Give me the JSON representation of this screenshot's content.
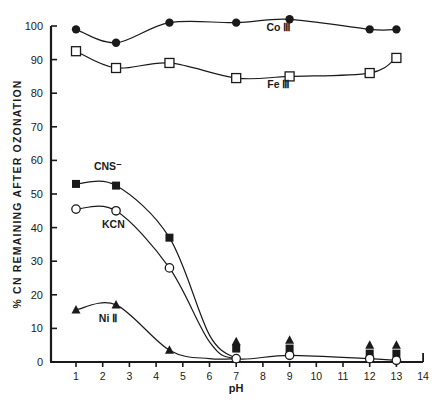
{
  "chart_data": {
    "type": "line",
    "title": "",
    "xlabel": "pH",
    "ylabel": "% CN REMAINING AFTER OZONATION",
    "xlim": [
      0.6,
      14
    ],
    "ylim": [
      0,
      100
    ],
    "xticks": [
      1,
      2,
      3,
      4,
      5,
      6,
      7,
      8,
      9,
      10,
      11,
      12,
      13,
      14
    ],
    "yticks": [
      0,
      10,
      20,
      30,
      40,
      50,
      60,
      70,
      80,
      90,
      100
    ],
    "grid": false,
    "legend": "inline labels",
    "series": [
      {
        "name": "Co III",
        "marker": "filled-circle",
        "x": [
          1,
          2.5,
          4.5,
          7,
          9,
          12,
          13
        ],
        "y": [
          99,
          95,
          101,
          101,
          102,
          99,
          99
        ]
      },
      {
        "name": "Fe III",
        "marker": "open-square",
        "x": [
          1,
          2.5,
          4.5,
          7,
          9,
          12,
          13
        ],
        "y": [
          92.5,
          87.5,
          89,
          84.5,
          85,
          86,
          90.5
        ]
      },
      {
        "name": "CNS⁻",
        "marker": "filled-square",
        "x": [
          1,
          2.5,
          4.5,
          7,
          9,
          12,
          13
        ],
        "y": [
          53,
          52.5,
          37,
          4,
          4,
          2.5,
          2.5
        ]
      },
      {
        "name": "KCN",
        "marker": "open-circle",
        "x": [
          1,
          2.5,
          4.5,
          7,
          9,
          12,
          13
        ],
        "y": [
          45.5,
          45,
          28,
          1,
          2,
          1,
          0.5
        ]
      },
      {
        "name": "Ni II",
        "marker": "filled-triangle",
        "x": [
          1,
          2.5,
          4.5,
          7,
          9,
          12,
          13
        ],
        "y": [
          15.5,
          17,
          3.5,
          6,
          6.5,
          5,
          5
        ]
      }
    ],
    "annotations": [
      {
        "text": "Co III",
        "x": 8.6,
        "y": 98.5
      },
      {
        "text": "Fe III",
        "x": 8.6,
        "y": 81.5
      },
      {
        "text": "CNS⁻",
        "x": 2.2,
        "y": 57
      },
      {
        "text": "KCN",
        "x": 2.4,
        "y": 40
      },
      {
        "text": "Ni II",
        "x": 2.2,
        "y": 12
      }
    ]
  }
}
